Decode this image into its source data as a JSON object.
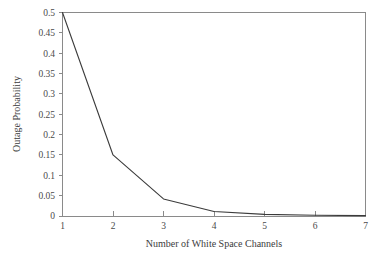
{
  "chart_data": {
    "type": "line",
    "title": "",
    "xlabel": "Number of White Space Channels",
    "ylabel": "Outage Probability",
    "x": [
      1,
      2,
      3,
      4,
      5,
      6,
      7
    ],
    "values": [
      0.5,
      0.15,
      0.042,
      0.011,
      0.004,
      0.002,
      0.001
    ],
    "series": [
      {
        "name": "Outage Probability",
        "values": [
          0.5,
          0.15,
          0.042,
          0.011,
          0.004,
          0.002,
          0.001
        ]
      }
    ],
    "xlim": [
      1,
      7
    ],
    "ylim": [
      0,
      0.5
    ],
    "xticks": [
      1,
      2,
      3,
      4,
      5,
      6,
      7
    ],
    "yticks": [
      0,
      0.05,
      0.1,
      0.15,
      0.2,
      0.25,
      0.3,
      0.35,
      0.4,
      0.45,
      0.5
    ],
    "xtick_labels": [
      "1",
      "2",
      "3",
      "4",
      "5",
      "6",
      "7"
    ],
    "ytick_labels": [
      "0",
      "0.05",
      "0.1",
      "0.15",
      "0.2",
      "0.25",
      "0.3",
      "0.35",
      "0.4",
      "0.45",
      "0.5"
    ],
    "grid": false,
    "legend": null,
    "legend_position": "none",
    "line_color": "#3b3b3b",
    "axis_color": "#8a8a8a",
    "background_color": "#ffffff"
  },
  "axes": {
    "x_title": "Number of White Space Channels",
    "y_title": "Outage Probability"
  }
}
